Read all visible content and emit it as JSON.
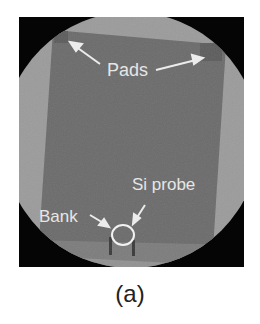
{
  "figure": {
    "caption": "(a)",
    "annotations": {
      "pads": "Pads",
      "si_probe": "Si probe",
      "bank": "Bank"
    },
    "colors": {
      "background_black": "#050505",
      "aperture_gray": "#9a9a9a",
      "sample_gray": "#6a6a6a",
      "label_white": "#e6e6e6",
      "caption_text": "#222222"
    }
  }
}
